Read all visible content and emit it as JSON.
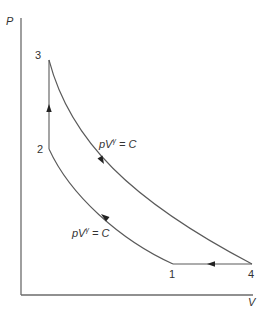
{
  "diagram": {
    "type": "pV-cycle",
    "axes": {
      "y_label": "P",
      "x_label": "V"
    },
    "points": [
      {
        "id": "1",
        "label": "1"
      },
      {
        "id": "2",
        "label": "2"
      },
      {
        "id": "3",
        "label": "3"
      },
      {
        "id": "4",
        "label": "4"
      }
    ],
    "processes": [
      {
        "from": "1",
        "to": "2",
        "kind": "adiabatic",
        "label_base": "pV",
        "label_exp": "γ",
        "label_rhs": " = C"
      },
      {
        "from": "2",
        "to": "3",
        "kind": "isochoric"
      },
      {
        "from": "3",
        "to": "4",
        "kind": "adiabatic",
        "label_base": "pV",
        "label_exp": "γ",
        "label_rhs": " = C"
      },
      {
        "from": "4",
        "to": "1",
        "kind": "isobaric"
      }
    ],
    "colors": {
      "line": "#5a5a5a",
      "axis": "#6b6b6b",
      "text": "#333333",
      "background": "#ffffff"
    }
  }
}
